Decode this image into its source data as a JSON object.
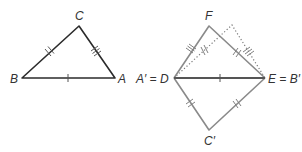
{
  "diagram": {
    "type": "geometry-triangle-congruence",
    "left_triangle": {
      "vertices": {
        "A": {
          "label": "A",
          "x": 115,
          "y": 78
        },
        "B": {
          "label": "B",
          "x": 22,
          "y": 78
        },
        "C": {
          "label": "C",
          "x": 79,
          "y": 26
        }
      },
      "tick_marks": {
        "AB": 1,
        "BC": 2,
        "CA": 3
      }
    },
    "right_figure": {
      "vertices": {
        "D": {
          "label": "A′ = D",
          "x": 174,
          "y": 78
        },
        "E": {
          "label": "E = B′",
          "x": 265,
          "y": 78
        },
        "F": {
          "label": "F",
          "x": 209,
          "y": 26
        },
        "C_prime": {
          "label": "C′",
          "x": 209,
          "y": 130
        },
        "dotted_apex": {
          "x": 232,
          "y": 25
        }
      },
      "tick_marks": {
        "DE": 1,
        "DF": 3,
        "FE": 2,
        "dotted_left": 2,
        "dotted_right": 3,
        "DC_prime": 2,
        "C_primeE": 2
      }
    },
    "labels": {
      "A": "A",
      "B": "B",
      "C": "C",
      "D": "A′ = D",
      "E": "E = B′",
      "F": "F",
      "C_prime": "C′"
    }
  }
}
